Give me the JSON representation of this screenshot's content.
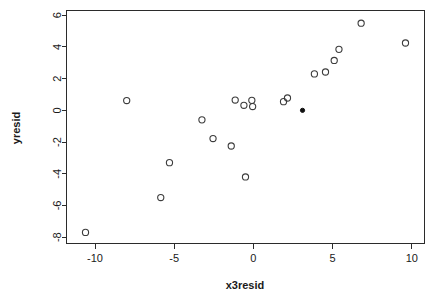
{
  "chart_data": {
    "type": "scatter",
    "title": "",
    "xlabel": "x3resid",
    "ylabel": "yresid",
    "xlim": [
      -11.8,
      10.8
    ],
    "ylim": [
      -8.4,
      6.3
    ],
    "xticks": [
      -10,
      -5,
      0,
      5,
      10
    ],
    "xtick_labels": [
      "-10",
      "-5",
      "0",
      "5",
      "10"
    ],
    "yticks": [
      6,
      4,
      2,
      0,
      -2,
      -4,
      -6,
      -8
    ],
    "ytick_labels": [
      "6",
      "4",
      "2",
      "0",
      "-2",
      "-4",
      "-6",
      "-8"
    ],
    "grid": false,
    "legend": null,
    "box": true,
    "marker": "open-circle",
    "marker_color": "#3c3c3c",
    "highlight_marker": "filled-circle",
    "highlight_color": "#111111",
    "n_points": 22,
    "points": [
      {
        "x": -10.6,
        "y": -7.7,
        "style": "open"
      },
      {
        "x": -8.0,
        "y": 0.62,
        "style": "open"
      },
      {
        "x": -5.85,
        "y": -5.5,
        "style": "open"
      },
      {
        "x": -5.3,
        "y": -3.3,
        "style": "open"
      },
      {
        "x": -3.25,
        "y": -0.6,
        "style": "open"
      },
      {
        "x": -2.55,
        "y": -1.78,
        "style": "open"
      },
      {
        "x": -1.4,
        "y": -2.25,
        "style": "open"
      },
      {
        "x": -1.15,
        "y": 0.65,
        "style": "open"
      },
      {
        "x": -0.6,
        "y": 0.32,
        "style": "open"
      },
      {
        "x": -0.5,
        "y": -4.2,
        "style": "open"
      },
      {
        "x": -0.1,
        "y": 0.63,
        "style": "open"
      },
      {
        "x": -0.05,
        "y": 0.24,
        "style": "open"
      },
      {
        "x": 1.9,
        "y": 0.55,
        "style": "open"
      },
      {
        "x": 2.15,
        "y": 0.78,
        "style": "open"
      },
      {
        "x": 3.1,
        "y": 0.0,
        "style": "filled"
      },
      {
        "x": 3.85,
        "y": 2.3,
        "style": "open"
      },
      {
        "x": 4.55,
        "y": 2.42,
        "style": "open"
      },
      {
        "x": 5.1,
        "y": 3.15,
        "style": "open"
      },
      {
        "x": 5.4,
        "y": 3.85,
        "style": "open"
      },
      {
        "x": 6.8,
        "y": 5.5,
        "style": "open"
      },
      {
        "x": 9.6,
        "y": 4.25,
        "style": "open"
      }
    ]
  },
  "figure": {
    "background": "#ffffff",
    "axis_color": "#2b2b2b"
  }
}
